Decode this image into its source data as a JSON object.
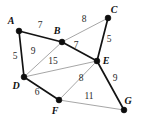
{
  "figure": {
    "kind": "weighted-undirected-graph",
    "width": 142,
    "height": 127,
    "background": "#ffffff"
  },
  "colors": {
    "thick_edge": "#131313",
    "thin_edge": "#8f8f8f",
    "vertex": "#0d0d0d",
    "vertex_label": "#101010",
    "weight_label": "#2a2a2a"
  },
  "chart_data": {
    "type": "diagram",
    "title": "",
    "nodes": [
      {
        "id": "A",
        "label": "A",
        "x": 19,
        "y": 31,
        "label_x": 11,
        "label_y": 24,
        "r": 2.9
      },
      {
        "id": "B",
        "label": "B",
        "x": 62,
        "y": 42,
        "label_x": 57,
        "label_y": 34,
        "r": 2.9
      },
      {
        "id": "C",
        "label": "C",
        "x": 108,
        "y": 18,
        "label_x": 114,
        "label_y": 13,
        "r": 2.9
      },
      {
        "id": "D",
        "label": "D",
        "x": 24,
        "y": 77,
        "label_x": 16,
        "label_y": 89,
        "r": 2.9
      },
      {
        "id": "E",
        "label": "E",
        "x": 97,
        "y": 61,
        "label_x": 106,
        "label_y": 64,
        "r": 2.9
      },
      {
        "id": "F",
        "label": "F",
        "x": 59,
        "y": 100,
        "label_x": 55,
        "label_y": 114,
        "r": 2.9
      },
      {
        "id": "G",
        "label": "G",
        "x": 124,
        "y": 110,
        "label_x": 128,
        "label_y": 104,
        "r": 2.9
      }
    ],
    "edges": [
      {
        "from": "A",
        "to": "B",
        "weight": "7",
        "weight_x": 40,
        "weight_y": 28,
        "style": "thick"
      },
      {
        "from": "A",
        "to": "D",
        "weight": "5",
        "weight_x": 15,
        "weight_y": 59,
        "style": "thick"
      },
      {
        "from": "B",
        "to": "C",
        "weight": "8",
        "weight_x": 84,
        "weight_y": 22,
        "style": "thin"
      },
      {
        "from": "B",
        "to": "D",
        "weight": "9",
        "weight_x": 33,
        "weight_y": 54,
        "style": "thin"
      },
      {
        "from": "B",
        "to": "E",
        "weight": "7",
        "weight_x": 76,
        "weight_y": 48,
        "style": "thick"
      },
      {
        "from": "C",
        "to": "E",
        "weight": "5",
        "weight_x": 109,
        "weight_y": 42,
        "style": "thick"
      },
      {
        "from": "D",
        "to": "E",
        "weight": "15",
        "weight_x": 53,
        "weight_y": 64,
        "style": "thin"
      },
      {
        "from": "D",
        "to": "F",
        "weight": "6",
        "weight_x": 37,
        "weight_y": 95,
        "style": "thick"
      },
      {
        "from": "E",
        "to": "F",
        "weight": "8",
        "weight_x": 81,
        "weight_y": 81,
        "style": "thin"
      },
      {
        "from": "E",
        "to": "G",
        "weight": "9",
        "weight_x": 115,
        "weight_y": 81,
        "style": "thick"
      },
      {
        "from": "F",
        "to": "G",
        "weight": "11",
        "weight_x": 89,
        "weight_y": 99,
        "style": "thin"
      }
    ],
    "node_count": 7,
    "edge_count": 11
  }
}
